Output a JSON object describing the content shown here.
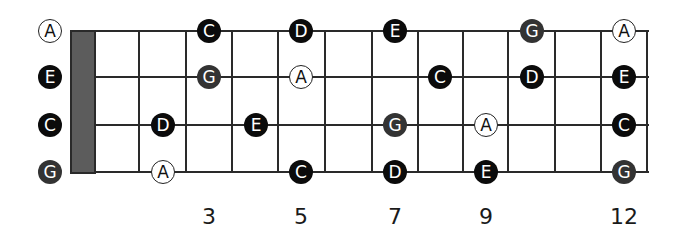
{
  "diagram": {
    "title": "",
    "strings": [
      {
        "index": 0,
        "open_note": "A",
        "y": 31
      },
      {
        "index": 1,
        "open_note": "E",
        "y": 77
      },
      {
        "index": 2,
        "open_note": "C",
        "y": 125
      },
      {
        "index": 3,
        "open_note": "G",
        "y": 172
      }
    ],
    "nut": {
      "x": 70,
      "width": 26
    },
    "fret_x": [
      139,
      186,
      232,
      278,
      325,
      372,
      418,
      463,
      508,
      555,
      601,
      647
    ],
    "fret_markers": [
      {
        "label": "3",
        "x": 209
      },
      {
        "label": "5",
        "x": 301
      },
      {
        "label": "7",
        "x": 395
      },
      {
        "label": "9",
        "x": 486
      },
      {
        "label": "12",
        "x": 624
      }
    ],
    "styles": {
      "black": "#0b0b0b",
      "dark": "#333333",
      "open": "#ffffff",
      "nut": "#5c5c5c",
      "line": "#2a2a2a"
    },
    "notes": [
      {
        "note": "A",
        "string": 0,
        "x": 50,
        "style": "open"
      },
      {
        "note": "E",
        "string": 1,
        "x": 50,
        "style": "black"
      },
      {
        "note": "C",
        "string": 2,
        "x": 50,
        "style": "black"
      },
      {
        "note": "G",
        "string": 3,
        "x": 50,
        "style": "dark"
      },
      {
        "note": "C",
        "string": 0,
        "x": 209,
        "style": "black"
      },
      {
        "note": "D",
        "string": 0,
        "x": 301,
        "style": "black"
      },
      {
        "note": "E",
        "string": 0,
        "x": 395,
        "style": "black"
      },
      {
        "note": "G",
        "string": 0,
        "x": 532,
        "style": "dark"
      },
      {
        "note": "A",
        "string": 0,
        "x": 624,
        "style": "open"
      },
      {
        "note": "G",
        "string": 1,
        "x": 209,
        "style": "dark"
      },
      {
        "note": "A",
        "string": 1,
        "x": 301,
        "style": "open"
      },
      {
        "note": "C",
        "string": 1,
        "x": 440,
        "style": "black"
      },
      {
        "note": "D",
        "string": 1,
        "x": 532,
        "style": "black"
      },
      {
        "note": "E",
        "string": 1,
        "x": 624,
        "style": "black"
      },
      {
        "note": "D",
        "string": 2,
        "x": 163,
        "style": "black"
      },
      {
        "note": "E",
        "string": 2,
        "x": 256,
        "style": "black"
      },
      {
        "note": "G",
        "string": 2,
        "x": 395,
        "style": "dark"
      },
      {
        "note": "A",
        "string": 2,
        "x": 486,
        "style": "open"
      },
      {
        "note": "C",
        "string": 2,
        "x": 624,
        "style": "black"
      },
      {
        "note": "A",
        "string": 3,
        "x": 163,
        "style": "open"
      },
      {
        "note": "C",
        "string": 3,
        "x": 301,
        "style": "black"
      },
      {
        "note": "D",
        "string": 3,
        "x": 395,
        "style": "black"
      },
      {
        "note": "E",
        "string": 3,
        "x": 486,
        "style": "black"
      },
      {
        "note": "G",
        "string": 3,
        "x": 624,
        "style": "dark"
      }
    ]
  }
}
